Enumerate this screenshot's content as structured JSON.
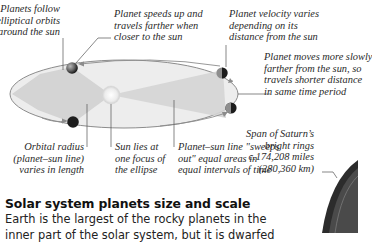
{
  "diagram": {
    "labels": {
      "elliptical_orbits": [
        "Planets follow",
        "elliptical orbits",
        "around the sun"
      ],
      "speeds_up": [
        "Planet speeds up and",
        "travels farther when",
        "closer to the sun"
      ],
      "velocity_varies": [
        "Planet velocity varies",
        "depending on its",
        "distance from the sun"
      ],
      "moves_slowly": [
        "Planet moves more slowly",
        "farther from the sun, so",
        "travels shorter distance",
        "in same time period"
      ],
      "orbital_radius": [
        "Orbital radius",
        "(planet–sun line)",
        "varies in length"
      ],
      "sun_focus": [
        "Sun lies at",
        "one focus of",
        "the ellipse"
      ],
      "equal_areas": [
        "Planet–sun line \"sweeps",
        "out\" equal areas in",
        "equal intervals of time"
      ],
      "saturn_rings": [
        "Span of Saturn’s",
        "bright rings",
        "c.174,208 miles",
        "(280,360 km)"
      ]
    },
    "colors": {
      "orbit_line": "#8a8a8a",
      "ellipse_fill": "#ececec",
      "swept_area": "#d2d2d2",
      "sun": "#f4f4f4",
      "planet_dark": "#1e1e1e",
      "planet_light": "#9a9a9a",
      "saturn": "#3a3a3a"
    }
  },
  "section": {
    "heading": "Solar system planets size and scale",
    "body_lines": [
      "Earth is the largest of the rocky planets in the",
      "inner part of the solar system, but it is dwarfed"
    ]
  }
}
